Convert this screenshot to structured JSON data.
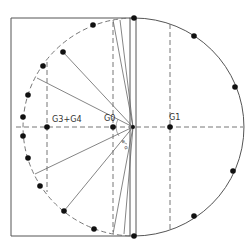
{
  "diagram": {
    "labels": {
      "g0": "G0",
      "g1": "G1",
      "g3g4": "G3+G4",
      "angle1": "α",
      "angle2": "α",
      "angle3": "α"
    },
    "colors": {
      "stroke": "#555555",
      "dashed": "#777777",
      "dot": "#111111",
      "background": "#ffffff"
    },
    "circle": {
      "cx": 133,
      "cy": 127,
      "r": 110
    },
    "dots_right_arc": [
      [
        134,
        18
      ],
      [
        194,
        36
      ],
      [
        235,
        87
      ],
      [
        233,
        171
      ],
      [
        194,
        216
      ],
      [
        134,
        236
      ]
    ],
    "dots_left_arc": [
      [
        93,
        25
      ],
      [
        63,
        52
      ],
      [
        43,
        66
      ],
      [
        28,
        95
      ],
      [
        23,
        117
      ],
      [
        23,
        136
      ],
      [
        28,
        158
      ],
      [
        40,
        186
      ],
      [
        64,
        211
      ],
      [
        94,
        229
      ]
    ],
    "dots_axis": {
      "g0": [
        113,
        127
      ],
      "g1": [
        170,
        127
      ],
      "g3g4": [
        47,
        127
      ]
    }
  }
}
